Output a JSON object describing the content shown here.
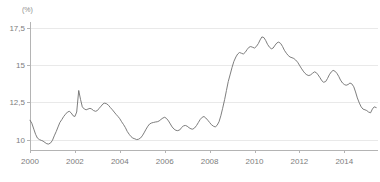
{
  "chart_data": {
    "type": "line",
    "title": "",
    "subtitle": "",
    "unit_label": "(%)",
    "xlabel": "",
    "ylabel": "",
    "xlim": [
      2000.0,
      2015.5
    ],
    "ylim": [
      9.3,
      17.9
    ],
    "grid": true,
    "grid_axis": "y",
    "legend": false,
    "legend_position": "none",
    "line_color": "#6f6f6f",
    "grid_color": "#e9e9e9",
    "axis_color": "#b4b4b4",
    "tick_text_color": "#7d7d7d",
    "background_color": "#ffffff",
    "yticks": [
      10,
      12.5,
      15,
      17.5
    ],
    "ytick_labels": [
      "10",
      "12,5",
      "15",
      "17,5"
    ],
    "xticks": [
      2000,
      2002,
      2004,
      2006,
      2008,
      2010,
      2012,
      2014
    ],
    "xtick_labels": [
      "2000",
      "2002",
      "2004",
      "2006",
      "2008",
      "2010",
      "2012",
      "2014"
    ],
    "series": [
      {
        "name": "rate",
        "x": [
          2000.0,
          2000.08,
          2000.17,
          2000.25,
          2000.33,
          2000.42,
          2000.5,
          2000.58,
          2000.67,
          2000.75,
          2000.83,
          2000.92,
          2001.0,
          2001.08,
          2001.17,
          2001.25,
          2001.33,
          2001.42,
          2001.5,
          2001.58,
          2001.67,
          2001.75,
          2001.83,
          2001.92,
          2002.0,
          2002.08,
          2002.17,
          2002.25,
          2002.33,
          2002.42,
          2002.5,
          2002.58,
          2002.67,
          2002.75,
          2002.83,
          2002.92,
          2003.0,
          2003.08,
          2003.17,
          2003.25,
          2003.33,
          2003.42,
          2003.5,
          2003.58,
          2003.67,
          2003.75,
          2003.83,
          2003.92,
          2004.0,
          2004.08,
          2004.17,
          2004.25,
          2004.33,
          2004.42,
          2004.5,
          2004.58,
          2004.67,
          2004.75,
          2004.83,
          2004.92,
          2005.0,
          2005.08,
          2005.17,
          2005.25,
          2005.33,
          2005.42,
          2005.5,
          2005.58,
          2005.67,
          2005.75,
          2005.83,
          2005.92,
          2006.0,
          2006.08,
          2006.17,
          2006.25,
          2006.33,
          2006.42,
          2006.5,
          2006.58,
          2006.67,
          2006.75,
          2006.83,
          2006.92,
          2007.0,
          2007.08,
          2007.17,
          2007.25,
          2007.33,
          2007.42,
          2007.5,
          2007.58,
          2007.67,
          2007.75,
          2007.83,
          2007.92,
          2008.0,
          2008.08,
          2008.17,
          2008.25,
          2008.33,
          2008.42,
          2008.5,
          2008.58,
          2008.67,
          2008.75,
          2008.83,
          2008.92,
          2009.0,
          2009.08,
          2009.17,
          2009.25,
          2009.33,
          2009.42,
          2009.5,
          2009.58,
          2009.67,
          2009.75,
          2009.83,
          2009.92,
          2010.0,
          2010.08,
          2010.17,
          2010.25,
          2010.33,
          2010.42,
          2010.5,
          2010.58,
          2010.67,
          2010.75,
          2010.83,
          2010.92,
          2011.0,
          2011.08,
          2011.17,
          2011.25,
          2011.33,
          2011.42,
          2011.5,
          2011.58,
          2011.67,
          2011.75,
          2011.83,
          2011.92,
          2012.0,
          2012.08,
          2012.17,
          2012.25,
          2012.33,
          2012.42,
          2012.5,
          2012.58,
          2012.67,
          2012.75,
          2012.83,
          2012.92,
          2013.0,
          2013.08,
          2013.17,
          2013.25,
          2013.33,
          2013.42,
          2013.5,
          2013.58,
          2013.67,
          2013.75,
          2013.83,
          2013.92,
          2014.0,
          2014.08,
          2014.17,
          2014.25,
          2014.33,
          2014.42,
          2014.5,
          2014.58,
          2014.67,
          2014.75,
          2014.83,
          2014.92,
          2015.0,
          2015.08,
          2015.17,
          2015.25,
          2015.33,
          2015.42
        ],
        "values": [
          11.3,
          11.1,
          10.7,
          10.35,
          10.1,
          10.0,
          9.95,
          9.9,
          9.8,
          9.72,
          9.7,
          9.78,
          9.95,
          10.25,
          10.55,
          10.85,
          11.15,
          11.35,
          11.55,
          11.7,
          11.85,
          11.9,
          11.8,
          11.6,
          11.55,
          11.85,
          13.3,
          12.7,
          12.2,
          12.05,
          12.0,
          12.05,
          12.1,
          12.05,
          11.95,
          11.9,
          11.95,
          12.1,
          12.25,
          12.4,
          12.45,
          12.4,
          12.3,
          12.15,
          12.0,
          11.85,
          11.7,
          11.55,
          11.4,
          11.2,
          11.0,
          10.8,
          10.55,
          10.35,
          10.2,
          10.1,
          10.05,
          10.0,
          10.02,
          10.1,
          10.25,
          10.45,
          10.7,
          10.9,
          11.05,
          11.12,
          11.15,
          11.18,
          11.2,
          11.25,
          11.35,
          11.45,
          11.5,
          11.42,
          11.25,
          11.05,
          10.85,
          10.7,
          10.62,
          10.6,
          10.65,
          10.8,
          10.92,
          10.95,
          10.9,
          10.8,
          10.72,
          10.7,
          10.78,
          10.95,
          11.15,
          11.35,
          11.5,
          11.55,
          11.45,
          11.3,
          11.15,
          11.0,
          10.9,
          10.85,
          10.95,
          11.2,
          11.6,
          12.1,
          12.7,
          13.3,
          13.9,
          14.4,
          14.85,
          15.25,
          15.55,
          15.75,
          15.85,
          15.8,
          15.75,
          15.85,
          16.05,
          16.2,
          16.25,
          16.2,
          16.15,
          16.25,
          16.45,
          16.7,
          16.9,
          16.85,
          16.65,
          16.4,
          16.2,
          16.1,
          16.15,
          16.35,
          16.5,
          16.55,
          16.45,
          16.25,
          16.0,
          15.8,
          15.65,
          15.55,
          15.5,
          15.45,
          15.35,
          15.2,
          15.0,
          14.8,
          14.6,
          14.45,
          14.35,
          14.3,
          14.35,
          14.45,
          14.55,
          14.5,
          14.35,
          14.15,
          13.95,
          13.85,
          13.9,
          14.1,
          14.35,
          14.55,
          14.65,
          14.6,
          14.45,
          14.25,
          14.0,
          13.8,
          13.7,
          13.65,
          13.7,
          13.8,
          13.75,
          13.55,
          13.2,
          12.8,
          12.45,
          12.2,
          12.05,
          12.0,
          11.95,
          11.85,
          11.8,
          12.05,
          12.2,
          12.15
        ]
      }
    ],
    "annotations": []
  },
  "axis": {
    "unit": "(%)"
  }
}
